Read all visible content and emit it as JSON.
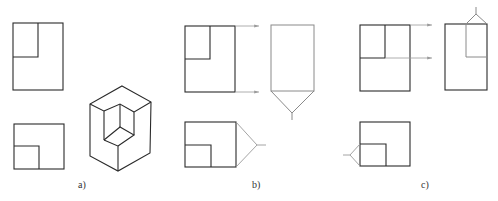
{
  "caption": {
    "text": "",
    "note": "top text cut off and illegible"
  },
  "panels": [
    {
      "id": "a",
      "label": "a)",
      "label_pos": [
        81,
        186
      ],
      "description": "Front view, top view and isometric of an L-notched block"
    },
    {
      "id": "b",
      "label": "b)",
      "label_pos": [
        255,
        186
      ],
      "description": "Projection with side view derived from front view; viewing direction from below and right"
    },
    {
      "id": "c",
      "label": "c)",
      "label_pos": [
        424,
        186
      ],
      "description": "Projection with side view derived from front view; viewing direction from above and left"
    }
  ],
  "colors": {
    "line": "#2a2a2a",
    "construction": "#9a9a9a",
    "background": "#ffffff"
  }
}
